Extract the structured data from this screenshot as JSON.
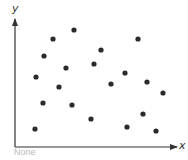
{
  "chart_data": {
    "type": "scatter",
    "title": "",
    "xlabel": "x",
    "ylabel": "y",
    "caption": "None",
    "grid": false,
    "legend": null,
    "ticks": false,
    "xlim": [
      0,
      160
    ],
    "ylim": [
      0,
      127
    ],
    "point_color": "#2a2a2a",
    "axis_color": "#333333",
    "points": [
      {
        "x": 59,
        "y": 117
      },
      {
        "x": 38,
        "y": 108
      },
      {
        "x": 123,
        "y": 108
      },
      {
        "x": 86,
        "y": 97
      },
      {
        "x": 29,
        "y": 91
      },
      {
        "x": 79,
        "y": 83
      },
      {
        "x": 51,
        "y": 79
      },
      {
        "x": 110,
        "y": 74
      },
      {
        "x": 21,
        "y": 70
      },
      {
        "x": 132,
        "y": 65
      },
      {
        "x": 96,
        "y": 63
      },
      {
        "x": 44,
        "y": 60
      },
      {
        "x": 148,
        "y": 54
      },
      {
        "x": 28,
        "y": 44
      },
      {
        "x": 57,
        "y": 42
      },
      {
        "x": 128,
        "y": 33
      },
      {
        "x": 76,
        "y": 28
      },
      {
        "x": 112,
        "y": 20
      },
      {
        "x": 20,
        "y": 18
      },
      {
        "x": 141,
        "y": 16
      }
    ]
  }
}
